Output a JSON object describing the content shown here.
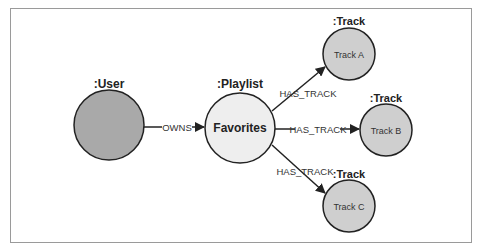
{
  "diagram": {
    "type": "graph",
    "nodes": [
      {
        "id": "user",
        "type_label": ":User",
        "name": "",
        "cx": 109,
        "cy": 125,
        "r": 35,
        "fill": "#a9a9a9"
      },
      {
        "id": "playlist",
        "type_label": ":Playlist",
        "name": "Favorites",
        "cx": 240,
        "cy": 128,
        "r": 35,
        "fill": "#eeeeee"
      },
      {
        "id": "track_a",
        "type_label": ":Track",
        "name": "Track A",
        "cx": 349,
        "cy": 54,
        "r": 26,
        "fill": "#cfcfcf"
      },
      {
        "id": "track_b",
        "type_label": ":Track",
        "name": "Track B",
        "cx": 386,
        "cy": 130,
        "r": 26,
        "fill": "#cfcfcf"
      },
      {
        "id": "track_c",
        "type_label": ":Track",
        "name": "Track C",
        "cx": 349,
        "cy": 206,
        "r": 26,
        "fill": "#cfcfcf"
      }
    ],
    "edges": [
      {
        "from": "user",
        "to": "playlist",
        "label": "OWNS"
      },
      {
        "from": "playlist",
        "to": "track_a",
        "label": "HAS_TRACK"
      },
      {
        "from": "playlist",
        "to": "track_b",
        "label": "HAS_TRACK"
      },
      {
        "from": "playlist",
        "to": "track_c",
        "label": "HAS_TRACK"
      }
    ],
    "colors": {
      "stroke": "#222222",
      "frame": "#9a9a9a",
      "background": "#ffffff"
    }
  }
}
